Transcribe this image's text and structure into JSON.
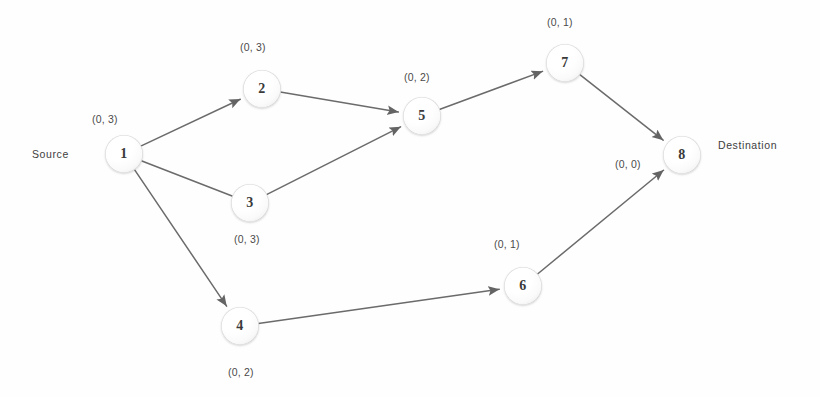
{
  "diagram": {
    "background_color": "#fefefe",
    "edge_color": "#6b6b6b",
    "node_text_color": "#3a3a3a",
    "label_color": "#4a4a4a"
  },
  "endpoints": {
    "source_label": "Source",
    "destination_label": "Destination"
  },
  "nodes": [
    {
      "id": "1",
      "label": "1",
      "cost": "(0, 3)",
      "x": 124,
      "y": 154,
      "cost_x": 92,
      "cost_y": 113
    },
    {
      "id": "2",
      "label": "2",
      "cost": "(0, 3)",
      "x": 262,
      "y": 89,
      "cost_x": 240,
      "cost_y": 41
    },
    {
      "id": "3",
      "label": "3",
      "cost": "(0, 3)",
      "x": 250,
      "y": 203,
      "cost_x": 234,
      "cost_y": 233
    },
    {
      "id": "4",
      "label": "4",
      "cost": "(0, 2)",
      "x": 240,
      "y": 326,
      "cost_x": 228,
      "cost_y": 366
    },
    {
      "id": "5",
      "label": "5",
      "cost": "(0, 2)",
      "x": 422,
      "y": 116,
      "cost_x": 404,
      "cost_y": 71
    },
    {
      "id": "6",
      "label": "6",
      "cost": "(0, 1)",
      "x": 523,
      "y": 286,
      "cost_x": 494,
      "cost_y": 238
    },
    {
      "id": "7",
      "label": "7",
      "cost": "(0, 1)",
      "x": 565,
      "y": 63,
      "cost_x": 547,
      "cost_y": 16
    },
    {
      "id": "8",
      "label": "8",
      "cost": "(0, 0)",
      "x": 682,
      "y": 155,
      "cost_x": 615,
      "cost_y": 158
    }
  ],
  "edges": [
    {
      "from": "1",
      "to": "2",
      "arrow": true
    },
    {
      "from": "1",
      "to": "3",
      "arrow": false
    },
    {
      "from": "1",
      "to": "4",
      "arrow": true
    },
    {
      "from": "2",
      "to": "5",
      "arrow": true
    },
    {
      "from": "3",
      "to": "5",
      "arrow": true
    },
    {
      "from": "5",
      "to": "7",
      "arrow": true
    },
    {
      "from": "7",
      "to": "8",
      "arrow": true
    },
    {
      "from": "4",
      "to": "6",
      "arrow": true
    },
    {
      "from": "6",
      "to": "8",
      "arrow": true
    }
  ],
  "endpoint_positions": {
    "source": {
      "x": 32,
      "y": 148
    },
    "destination": {
      "x": 718,
      "y": 139
    }
  }
}
